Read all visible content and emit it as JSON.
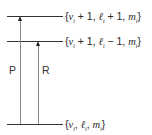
{
  "diagram": {
    "type": "energy-level-diagram",
    "levels": [
      {
        "id": "upper",
        "label": "{v_i + 1, ℓ_i + 1, m_i}",
        "parts": [
          "{",
          "v",
          "i",
          " + 1, ",
          "ℓ",
          "i",
          " + 1, ",
          "m",
          "i",
          "}"
        ]
      },
      {
        "id": "middle",
        "label": "{v_i + 1, ℓ_i − 1, m_i}",
        "parts": [
          "{",
          "v",
          "i",
          " + 1, ",
          "ℓ",
          "i",
          " − 1, ",
          "m",
          "i",
          "}"
        ]
      },
      {
        "id": "ground",
        "label": "{v_i, ℓ_i, m_i}",
        "parts": [
          "{",
          "v",
          "i",
          ", ",
          "ℓ",
          "i",
          ", ",
          "m",
          "i",
          "}"
        ]
      }
    ],
    "transitions": [
      {
        "label": "P",
        "from": "ground",
        "to": "upper"
      },
      {
        "label": "R",
        "from": "ground",
        "to": "middle"
      }
    ]
  }
}
